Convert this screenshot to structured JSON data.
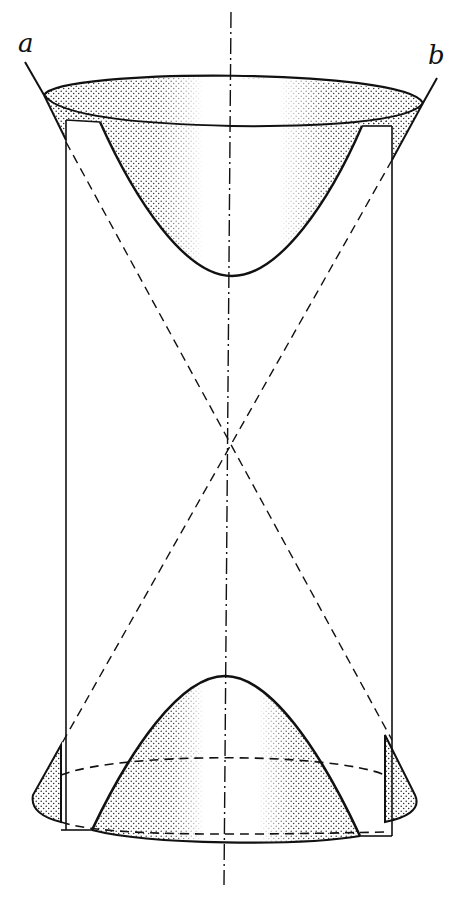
{
  "figure": {
    "labels": {
      "a": "a",
      "b": "b"
    },
    "colors": {
      "ink": "#111111",
      "stipple": "#222222",
      "background": "#ffffff"
    },
    "elements": [
      {
        "name": "vertical-axis",
        "style": "dash-dot"
      },
      {
        "name": "asymptotic-cone-lines",
        "style": "dashed"
      },
      {
        "name": "cylinder-outline",
        "style": "solid"
      },
      {
        "name": "upper-sheet",
        "style": "stippled"
      },
      {
        "name": "lower-sheet",
        "style": "stippled"
      },
      {
        "name": "generator-line-a",
        "style": "solid"
      },
      {
        "name": "generator-line-b",
        "style": "solid"
      }
    ]
  }
}
